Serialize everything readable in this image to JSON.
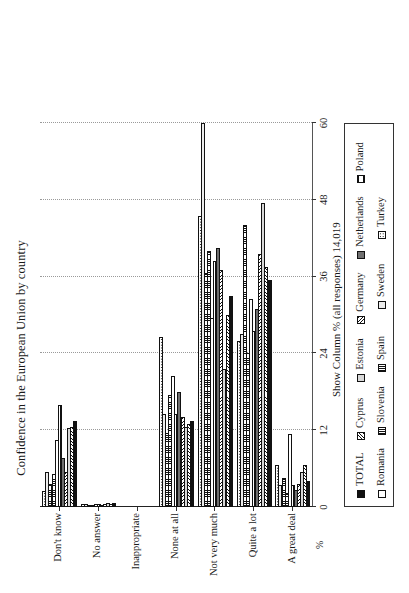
{
  "chart_data": {
    "type": "bar",
    "orientation": "horizontal-rotated",
    "title": "Confidence in the European Union by country",
    "subtitle": "Show Column % (all responses) 14,019",
    "xlabel": "",
    "ylabel": "%",
    "axis_unit": "%",
    "ylim": [
      0,
      60
    ],
    "yticks": [
      "0",
      "12",
      "24",
      "36",
      "48",
      "60"
    ],
    "ytick_values": [
      0,
      12,
      24,
      36,
      48,
      60
    ],
    "grid": "dotted vertical gridlines at each tick",
    "legend_position": "below plot, bordered box, 2 rows",
    "categories": [
      "A great deal",
      "Quite a lot",
      "Not very much",
      "None at all",
      "Inappropriate",
      "No answer",
      "Don't know"
    ],
    "series": [
      {
        "name": "TOTAL",
        "pattern": "solid-black",
        "values": [
          4.0,
          35.5,
          33.0,
          13.5,
          0.0,
          0.6,
          13.4
        ]
      },
      {
        "name": "Cyprus",
        "pattern": "diagonal-hatch-1",
        "values": [
          6.6,
          37.5,
          30.0,
          13.0,
          0.0,
          0.4,
          12.5
        ]
      },
      {
        "name": "Estonia",
        "pattern": "light-grey",
        "values": [
          5.5,
          47.5,
          21.5,
          12.5,
          0.0,
          0.6,
          12.4
        ]
      },
      {
        "name": "Germany",
        "pattern": "diagonal-hatch-2",
        "values": [
          3.6,
          39.5,
          37.0,
          14.0,
          0.0,
          0.5,
          5.4
        ]
      },
      {
        "name": "Netherlands",
        "pattern": "dark-grey",
        "values": [
          2.6,
          31.0,
          40.5,
          18.0,
          0.0,
          0.3,
          7.6
        ]
      },
      {
        "name": "Poland",
        "pattern": "horizontal-hatch",
        "values": [
          3.4,
          27.5,
          38.5,
          14.5,
          0.0,
          0.5,
          16.0
        ]
      },
      {
        "name": "Romania",
        "pattern": "white",
        "values": [
          11.4,
          32.5,
          29.5,
          20.5,
          0.0,
          0.5,
          10.5
        ]
      },
      {
        "name": "Slovenia",
        "pattern": "vertical-hatch",
        "values": [
          2.2,
          24.0,
          40.0,
          17.5,
          0.0,
          0.3,
          5.2
        ]
      },
      {
        "name": "Spain",
        "pattern": "cross-hatch",
        "values": [
          4.6,
          44.0,
          36.5,
          11.5,
          0.0,
          0.3,
          3.6
        ]
      },
      {
        "name": "Sweden",
        "pattern": "very-light-grey",
        "values": [
          3.5,
          27.0,
          60.0,
          14.5,
          0.0,
          0.4,
          5.5
        ]
      },
      {
        "name": "Turkey",
        "pattern": "dotted",
        "values": [
          6.5,
          26.0,
          45.5,
          26.5,
          0.0,
          0.4,
          2.5
        ]
      }
    ]
  },
  "legend": {
    "row1": [
      "TOTAL",
      "Cyprus",
      "Estonia",
      "Germany",
      "Netherlands",
      "Poland"
    ],
    "row2": [
      "Romania",
      "Slovenia",
      "Spain",
      "Sweden",
      "Turkey"
    ]
  }
}
